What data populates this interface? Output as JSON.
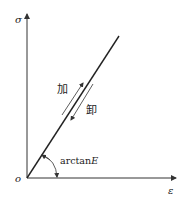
{
  "diagram": {
    "type": "stress-strain linear elastic",
    "axes": {
      "y_label": "σ",
      "x_label": "ε",
      "origin_label": "o"
    },
    "labels": {
      "loading": "加",
      "unloading": "卸",
      "slope_prefix": "arctan",
      "slope_var": "E"
    },
    "colors": {
      "line": "#222222",
      "axis": "#333333",
      "background": "#ffffff"
    }
  }
}
